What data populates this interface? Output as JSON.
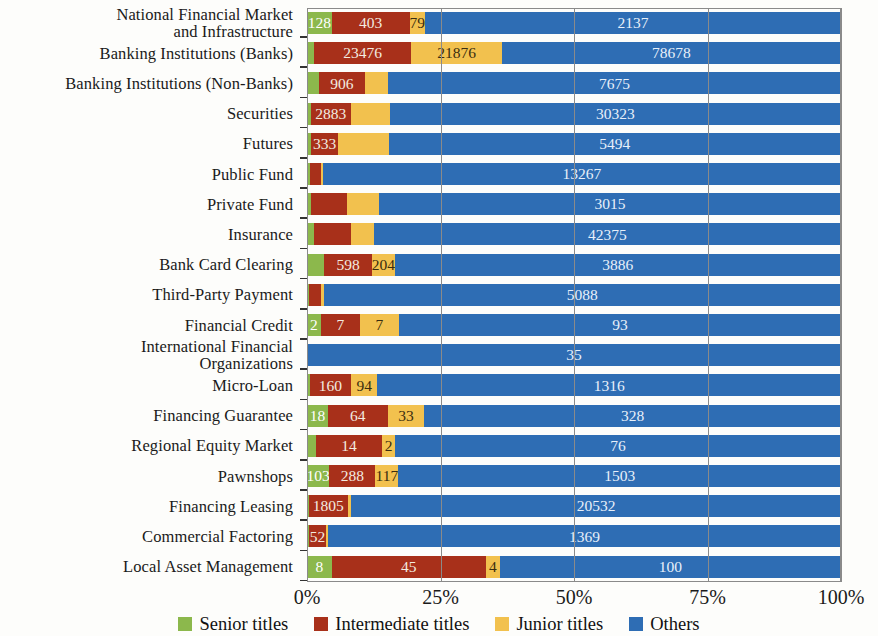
{
  "chart_data": {
    "type": "bar",
    "subtype": "horizontal-stacked-100-percent",
    "title": "",
    "xlabel": "",
    "ylabel": "",
    "xlim": [
      0,
      100
    ],
    "xticks": [
      "0%",
      "25%",
      "50%",
      "75%",
      "100%"
    ],
    "xtick_values": [
      0,
      25,
      50,
      75,
      100
    ],
    "grid": true,
    "legend_position": "bottom",
    "series_names": [
      "Senior titles",
      "Intermediate titles",
      "Junior titles",
      "Others"
    ],
    "colors": {
      "senior": "#8CB84C",
      "intermediate": "#A8301A",
      "junior": "#F2C14E",
      "others": "#2E6DB4",
      "axis": "#8A8A8A",
      "text": "#1A1A1A"
    },
    "categories": [
      "National Financial Market\nand Infrastructure",
      "Banking Institutions (Banks)",
      "Banking Institutions (Non-Banks)",
      "Securities",
      "Futures",
      "Public Fund",
      "Private Fund",
      "Insurance",
      "Bank Card Clearing",
      "Third-Party Payment",
      "Financial Credit",
      "International Financial\nOrganizations",
      "Micro-Loan",
      "Financing Guarantee",
      "Regional Equity Market",
      "Pawnshops",
      "Financing Leasing",
      "Commercial Factoring",
      "Local Asset Management"
    ],
    "series": [
      {
        "name": "Senior titles",
        "key": "senior",
        "values": [
          128,
          1060,
          300,
          120,
          90,
          40,
          30,
          330,
          290,
          20,
          2,
          0,
          30,
          18,
          8,
          103,
          40,
          10,
          8
        ]
      },
      {
        "name": "Intermediate titles",
        "key": "intermediate",
        "values": [
          403,
          23476,
          906,
          2883,
          333,
          160,
          340,
          2600,
          598,
          120,
          7,
          0,
          160,
          64,
          14,
          288,
          1805,
          52,
          45
        ]
      },
      {
        "name": "Junior titles",
        "key": "junior",
        "values": [
          79,
          21876,
          700,
          2900,
          430,
          20,
          330,
          1700,
          204,
          10,
          7,
          0,
          94,
          33,
          2,
          117,
          100,
          5,
          4
        ]
      },
      {
        "name": "Others",
        "key": "others",
        "values": [
          2137,
          78678,
          7675,
          30323,
          5494,
          13267,
          3015,
          42375,
          3886,
          5088,
          93,
          35,
          1316,
          328,
          76,
          1503,
          20532,
          1369,
          100
        ]
      }
    ],
    "rows": [
      {
        "category": "National Financial Market\nand Infrastructure",
        "segments": [
          {
            "key": "senior",
            "label": "128",
            "percent": 4.6,
            "show_label": true
          },
          {
            "key": "intermediate",
            "label": "403",
            "percent": 14.6,
            "show_label": true
          },
          {
            "key": "junior",
            "label": "79",
            "percent": 2.9,
            "show_label": true
          },
          {
            "key": "others",
            "label": "2137",
            "percent": 77.9,
            "show_label": true
          }
        ]
      },
      {
        "category": "Banking Institutions (Banks)",
        "segments": [
          {
            "key": "senior",
            "label": "1060",
            "percent": 1.3,
            "show_label": false
          },
          {
            "key": "intermediate",
            "label": "23476",
            "percent": 18.2,
            "show_label": true
          },
          {
            "key": "junior",
            "label": "21876",
            "percent": 17.0,
            "show_label": true
          },
          {
            "key": "others",
            "label": "78678",
            "percent": 63.5,
            "show_label": true
          }
        ]
      },
      {
        "category": "Banking Institutions (Non-Banks)",
        "segments": [
          {
            "key": "senior",
            "label": "300",
            "percent": 2.2,
            "show_label": false
          },
          {
            "key": "intermediate",
            "label": "906",
            "percent": 8.7,
            "show_label": true
          },
          {
            "key": "junior",
            "label": "700",
            "percent": 4.3,
            "show_label": false
          },
          {
            "key": "others",
            "label": "7675",
            "percent": 84.8,
            "show_label": true
          }
        ]
      },
      {
        "category": "Securities",
        "segments": [
          {
            "key": "senior",
            "label": "120",
            "percent": 0.7,
            "show_label": false
          },
          {
            "key": "intermediate",
            "label": "2883",
            "percent": 7.5,
            "show_label": true
          },
          {
            "key": "junior",
            "label": "2900",
            "percent": 7.3,
            "show_label": false
          },
          {
            "key": "others",
            "label": "30323",
            "percent": 84.5,
            "show_label": true
          }
        ]
      },
      {
        "category": "Futures",
        "segments": [
          {
            "key": "senior",
            "label": "90",
            "percent": 0.8,
            "show_label": false
          },
          {
            "key": "intermediate",
            "label": "333",
            "percent": 5.0,
            "show_label": true
          },
          {
            "key": "junior",
            "label": "430",
            "percent": 9.5,
            "show_label": false
          },
          {
            "key": "others",
            "label": "5494",
            "percent": 84.7,
            "show_label": true
          }
        ]
      },
      {
        "category": "Public Fund",
        "segments": [
          {
            "key": "senior",
            "label": "40",
            "percent": 0.6,
            "show_label": false
          },
          {
            "key": "intermediate",
            "label": "160",
            "percent": 2.0,
            "show_label": false
          },
          {
            "key": "junior",
            "label": "20",
            "percent": 0.4,
            "show_label": false
          },
          {
            "key": "others",
            "label": "13267",
            "percent": 97.0,
            "show_label": true
          }
        ]
      },
      {
        "category": "Private Fund",
        "segments": [
          {
            "key": "senior",
            "label": "30",
            "percent": 0.8,
            "show_label": false
          },
          {
            "key": "intermediate",
            "label": "340",
            "percent": 6.6,
            "show_label": false
          },
          {
            "key": "junior",
            "label": "330",
            "percent": 6.1,
            "show_label": false
          },
          {
            "key": "others",
            "label": "3015",
            "percent": 86.5,
            "show_label": true
          }
        ]
      },
      {
        "category": "Insurance",
        "segments": [
          {
            "key": "senior",
            "label": "330",
            "percent": 1.4,
            "show_label": false
          },
          {
            "key": "intermediate",
            "label": "2600",
            "percent": 6.8,
            "show_label": false
          },
          {
            "key": "junior",
            "label": "1700",
            "percent": 4.3,
            "show_label": false
          },
          {
            "key": "others",
            "label": "42375",
            "percent": 87.5,
            "show_label": true
          }
        ]
      },
      {
        "category": "Bank Card Clearing",
        "segments": [
          {
            "key": "senior",
            "label": "290",
            "percent": 3.2,
            "show_label": false
          },
          {
            "key": "intermediate",
            "label": "598",
            "percent": 9.0,
            "show_label": true
          },
          {
            "key": "junior",
            "label": "204",
            "percent": 4.2,
            "show_label": true
          },
          {
            "key": "others",
            "label": "3886",
            "percent": 83.6,
            "show_label": true
          }
        ]
      },
      {
        "category": "Third-Party Payment",
        "segments": [
          {
            "key": "senior",
            "label": "20",
            "percent": 0.4,
            "show_label": false
          },
          {
            "key": "intermediate",
            "label": "120",
            "percent": 2.2,
            "show_label": false
          },
          {
            "key": "junior",
            "label": "10",
            "percent": 0.5,
            "show_label": false
          },
          {
            "key": "others",
            "label": "5088",
            "percent": 96.9,
            "show_label": true
          }
        ]
      },
      {
        "category": "Financial Credit",
        "segments": [
          {
            "key": "senior",
            "label": "2",
            "percent": 2.6,
            "show_label": true
          },
          {
            "key": "intermediate",
            "label": "7",
            "percent": 7.3,
            "show_label": true
          },
          {
            "key": "junior",
            "label": "7",
            "percent": 7.3,
            "show_label": true
          },
          {
            "key": "others",
            "label": "93",
            "percent": 82.8,
            "show_label": true
          }
        ]
      },
      {
        "category": "International Financial\nOrganizations",
        "segments": [
          {
            "key": "senior",
            "label": "0",
            "percent": 0,
            "show_label": false
          },
          {
            "key": "intermediate",
            "label": "0",
            "percent": 0,
            "show_label": false
          },
          {
            "key": "junior",
            "label": "0",
            "percent": 0,
            "show_label": false
          },
          {
            "key": "others",
            "label": "35",
            "percent": 100,
            "show_label": true
          }
        ]
      },
      {
        "category": "Micro-Loan",
        "segments": [
          {
            "key": "senior",
            "label": "30",
            "percent": 0.6,
            "show_label": false
          },
          {
            "key": "intermediate",
            "label": "160",
            "percent": 7.6,
            "show_label": true
          },
          {
            "key": "junior",
            "label": "94",
            "percent": 5.0,
            "show_label": true
          },
          {
            "key": "others",
            "label": "1316",
            "percent": 86.8,
            "show_label": true
          }
        ]
      },
      {
        "category": "Financing Guarantee",
        "segments": [
          {
            "key": "senior",
            "label": "18",
            "percent": 3.9,
            "show_label": true
          },
          {
            "key": "intermediate",
            "label": "64",
            "percent": 11.2,
            "show_label": true
          },
          {
            "key": "junior",
            "label": "33",
            "percent": 6.9,
            "show_label": true
          },
          {
            "key": "others",
            "label": "328",
            "percent": 78.0,
            "show_label": true
          }
        ]
      },
      {
        "category": "Regional Equity Market",
        "segments": [
          {
            "key": "senior",
            "label": "8",
            "percent": 1.6,
            "show_label": false
          },
          {
            "key": "intermediate",
            "label": "14",
            "percent": 12.5,
            "show_label": true
          },
          {
            "key": "junior",
            "label": "2",
            "percent": 2.4,
            "show_label": true
          },
          {
            "key": "others",
            "label": "76",
            "percent": 83.5,
            "show_label": true
          }
        ]
      },
      {
        "category": "Pawnshops",
        "segments": [
          {
            "key": "senior",
            "label": "103",
            "percent": 4.2,
            "show_label": true
          },
          {
            "key": "intermediate",
            "label": "288",
            "percent": 8.6,
            "show_label": true
          },
          {
            "key": "junior",
            "label": "117",
            "percent": 4.3,
            "show_label": true
          },
          {
            "key": "others",
            "label": "1503",
            "percent": 82.9,
            "show_label": true
          }
        ]
      },
      {
        "category": "Financing Leasing",
        "segments": [
          {
            "key": "senior",
            "label": "40",
            "percent": 0.3,
            "show_label": false
          },
          {
            "key": "intermediate",
            "label": "1805",
            "percent": 7.4,
            "show_label": true
          },
          {
            "key": "junior",
            "label": "100",
            "percent": 0.6,
            "show_label": false
          },
          {
            "key": "others",
            "label": "20532",
            "percent": 91.7,
            "show_label": true
          }
        ]
      },
      {
        "category": "Commercial Factoring",
        "segments": [
          {
            "key": "senior",
            "label": "10",
            "percent": 0.3,
            "show_label": false
          },
          {
            "key": "intermediate",
            "label": "52",
            "percent": 3.3,
            "show_label": true
          },
          {
            "key": "junior",
            "label": "5",
            "percent": 0.3,
            "show_label": false
          },
          {
            "key": "others",
            "label": "1369",
            "percent": 96.1,
            "show_label": true
          }
        ]
      },
      {
        "category": "Local Asset Management",
        "segments": [
          {
            "key": "senior",
            "label": "8",
            "percent": 4.6,
            "show_label": true
          },
          {
            "key": "intermediate",
            "label": "45",
            "percent": 28.9,
            "show_label": true
          },
          {
            "key": "junior",
            "label": "4",
            "percent": 2.6,
            "show_label": true
          },
          {
            "key": "others",
            "label": "100",
            "percent": 63.9,
            "show_label": true
          }
        ]
      }
    ]
  },
  "legend": {
    "items": [
      {
        "label": "Senior titles",
        "key": "senior"
      },
      {
        "label": "Intermediate titles",
        "key": "intermediate"
      },
      {
        "label": "Junior titles",
        "key": "junior"
      },
      {
        "label": "Others",
        "key": "others"
      }
    ]
  }
}
